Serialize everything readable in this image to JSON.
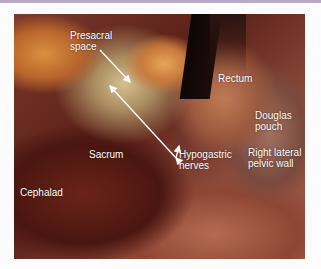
{
  "figure": {
    "labels": {
      "presacral_space": "Presacral\nspace",
      "rectum": "Rectum",
      "douglas_pouch": "Douglas\npouch",
      "sacrum": "Sacrum",
      "hypogastric_nerves": "Hypogastric\nnerves",
      "right_lateral_pelvic_wall": "Right lateral\npelvic wall",
      "cephalad": "Cephalad"
    },
    "colors": {
      "label_text": "#ffffff",
      "arrow": "#ffffff",
      "top_strip": "#b7a9c4",
      "background": "#fdfcfd"
    }
  }
}
